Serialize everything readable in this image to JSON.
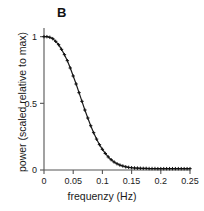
{
  "figure": {
    "panel_label": "B",
    "background_color": "#ffffff",
    "line_color": "#1a1a1a",
    "marker_color": "#111111",
    "axis_color": "#555555"
  },
  "chart_data": {
    "type": "line",
    "title": "B",
    "xlabel": "frequenzy (Hz)",
    "ylabel": "power (scaled relative to max)",
    "xlim": [
      0,
      0.25
    ],
    "ylim": [
      0,
      1.05
    ],
    "xticks": [
      0,
      0.05,
      0.1,
      0.15,
      0.2,
      0.25
    ],
    "xticklabels": [
      "0",
      "0.05",
      "0.1",
      "0.15",
      "0.2",
      "0.25"
    ],
    "yticks": [
      0,
      0.5,
      1
    ],
    "yticklabels": [
      "0",
      "0.5",
      "1"
    ],
    "grid": false,
    "legend": false,
    "marker": "+",
    "series": [
      {
        "name": "power spectrum",
        "x": [
          0.0,
          0.005,
          0.01,
          0.015,
          0.02,
          0.025,
          0.03,
          0.035,
          0.04,
          0.045,
          0.05,
          0.055,
          0.06,
          0.065,
          0.07,
          0.075,
          0.08,
          0.085,
          0.09,
          0.095,
          0.1,
          0.105,
          0.11,
          0.115,
          0.12,
          0.125,
          0.13,
          0.135,
          0.14,
          0.145,
          0.15,
          0.155,
          0.16,
          0.165,
          0.17,
          0.175,
          0.18,
          0.185,
          0.19,
          0.195,
          0.2,
          0.205,
          0.21,
          0.215,
          0.22,
          0.225,
          0.23,
          0.235,
          0.24,
          0.245,
          0.25
        ],
        "y": [
          1.0,
          1.0,
          0.995,
          0.985,
          0.965,
          0.94,
          0.905,
          0.865,
          0.82,
          0.765,
          0.705,
          0.645,
          0.58,
          0.515,
          0.45,
          0.39,
          0.332,
          0.28,
          0.232,
          0.19,
          0.155,
          0.124,
          0.098,
          0.077,
          0.06,
          0.047,
          0.037,
          0.03,
          0.024,
          0.02,
          0.017,
          0.015,
          0.014,
          0.013,
          0.012,
          0.012,
          0.011,
          0.011,
          0.011,
          0.01,
          0.01,
          0.01,
          0.01,
          0.01,
          0.01,
          0.01,
          0.01,
          0.01,
          0.01,
          0.01,
          0.01
        ]
      }
    ]
  }
}
